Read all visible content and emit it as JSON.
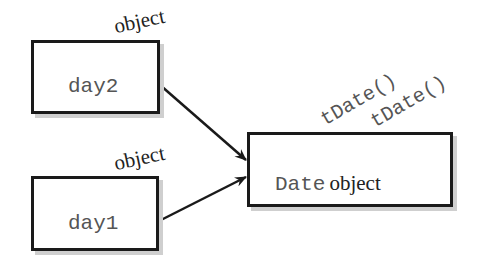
{
  "diagram": {
    "variables": [
      {
        "name": "day2",
        "tag": "object"
      },
      {
        "name": "day1",
        "tag": "object"
      }
    ],
    "target": {
      "type_text": "Date",
      "kind_text": "object",
      "methods": [
        "tDate()",
        "tDate()"
      ]
    },
    "colors": {
      "stroke": "#1a1a1a",
      "shadow": "#cfcfcf",
      "mono_text": "#555555"
    }
  }
}
